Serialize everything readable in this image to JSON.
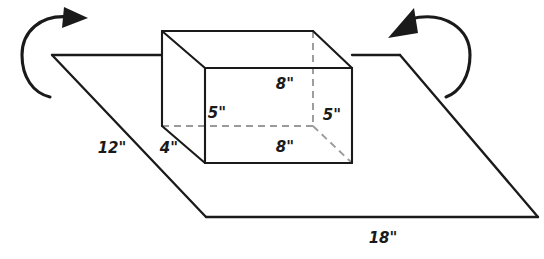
{
  "figure": {
    "background_color": "#ffffff",
    "line_color": "#1a1a1a",
    "hidden_line_color": "#9a9a9a",
    "labels": {
      "plane_left": "12\"",
      "plane_front": "18\"",
      "box_depth": "4\"",
      "box_width_top": "8\"",
      "box_width_bottom": "8\"",
      "box_height_left": "5\"",
      "box_height_right": "5\""
    },
    "icons": {
      "left_rotation": "rotate-arrow-ccw-icon",
      "right_rotation": "rotate-arrow-cw-icon"
    }
  }
}
